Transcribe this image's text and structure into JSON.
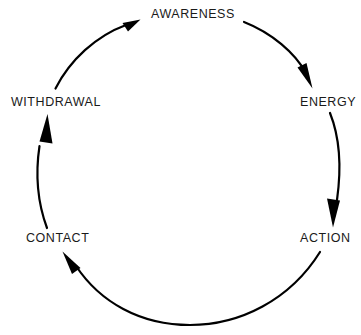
{
  "diagram": {
    "type": "cyclic-process-diagram",
    "direction": "clockwise",
    "background_color": "#ffffff",
    "stroke_color": "#000000",
    "text_color": "#1a1a1a",
    "nodes": [
      {
        "id": "awareness",
        "label": "AWARENESS",
        "position": "top"
      },
      {
        "id": "energy",
        "label": "ENERGY",
        "position": "upper-right"
      },
      {
        "id": "action",
        "label": "ACTION",
        "position": "lower-right"
      },
      {
        "id": "contact",
        "label": "CONTACT",
        "position": "lower-left"
      },
      {
        "id": "withdrawal",
        "label": "WITHDRAWAL",
        "position": "upper-left"
      }
    ],
    "arrows": [
      {
        "id": "awareness-to-energy",
        "from": "AWARENESS",
        "to": "ENERGY"
      },
      {
        "id": "energy-to-action",
        "from": "ENERGY",
        "to": "ACTION"
      },
      {
        "id": "action-to-contact",
        "from": "ACTION",
        "to": "CONTACT"
      },
      {
        "id": "contact-to-withdrawal",
        "from": "CONTACT",
        "to": "WITHDRAWAL"
      },
      {
        "id": "withdrawal-to-awareness",
        "from": "WITHDRAWAL",
        "to": "AWARENESS"
      }
    ]
  }
}
